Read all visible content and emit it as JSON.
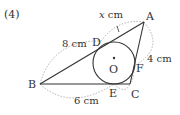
{
  "problem": {
    "number": "(4)"
  },
  "diagram": {
    "colors": {
      "line": "#333333",
      "dashed": "#9a9a9a",
      "text": "#333333"
    },
    "points": {
      "A": {
        "label": "A",
        "x": 144,
        "y": 22
      },
      "B": {
        "label": "B",
        "x": 40,
        "y": 84
      },
      "C": {
        "label": "C",
        "x": 130,
        "y": 84
      },
      "D": {
        "label": "D",
        "x": 101,
        "y": 41
      },
      "E": {
        "label": "E",
        "x": 114,
        "y": 84
      },
      "F": {
        "label": "F",
        "x": 134,
        "y": 64
      },
      "O": {
        "label": "O",
        "x": 114,
        "y": 63
      }
    },
    "circle": {
      "cx": 114,
      "cy": 63,
      "r": 21
    },
    "measurements": {
      "AD": "x cm",
      "BD": "8 cm",
      "AF": "4 cm",
      "BE": "6 cm"
    }
  }
}
